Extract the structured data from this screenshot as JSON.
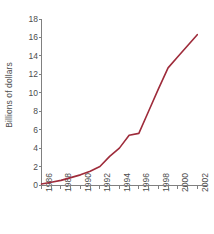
{
  "chart_data": {
    "type": "line",
    "title": "",
    "subtitle": "",
    "xlabel": "",
    "ylabel": "Billions of dollars",
    "x": [
      1986,
      1987,
      1988,
      1989,
      1990,
      1991,
      1992,
      1993,
      1994,
      1995,
      1996,
      1997,
      1998,
      1999,
      2000,
      2001,
      2002
    ],
    "values": [
      0.1,
      0.3,
      0.5,
      0.8,
      1.1,
      1.5,
      2.0,
      3.1,
      4.0,
      5.4,
      5.6,
      8.0,
      10.4,
      12.7,
      13.9,
      15.1,
      16.3
    ],
    "series": [
      {
        "name": "Billions of dollars",
        "values": [
          0.1,
          0.3,
          0.5,
          0.8,
          1.1,
          1.5,
          2.0,
          3.1,
          4.0,
          5.4,
          5.6,
          8.0,
          10.4,
          12.7,
          13.9,
          15.1,
          16.3
        ],
        "color": "#9e2b3a"
      }
    ],
    "xlim": [
      1986,
      2003
    ],
    "ylim": [
      0,
      18
    ],
    "ytick_values": [
      0,
      2,
      4,
      6,
      8,
      10,
      12,
      14,
      16,
      18
    ],
    "ytick_labels": [
      "0",
      "2",
      "4",
      "6",
      "8",
      "10",
      "12",
      "14",
      "16",
      "18"
    ],
    "xtick_values": [
      1986,
      1987,
      1988,
      1989,
      1990,
      1991,
      1992,
      1993,
      1994,
      1995,
      1996,
      1997,
      1998,
      1999,
      2000,
      2001,
      2002
    ],
    "xtick_labeled": [
      1986,
      1988,
      1990,
      1992,
      1994,
      1996,
      1998,
      2000,
      2002
    ],
    "xtick_labels": [
      "1986",
      "1988",
      "1990",
      "1992",
      "1994",
      "1996",
      "1998",
      "2000",
      "2002"
    ],
    "xtick_label_rotation": 90,
    "grid": false,
    "legend": false,
    "legend_position": "none",
    "line_color": "#9e2b3a",
    "axis_color": "#808080",
    "text_color": "#4d4d4d",
    "background": "#ffffff",
    "markers": false,
    "annotations": []
  }
}
